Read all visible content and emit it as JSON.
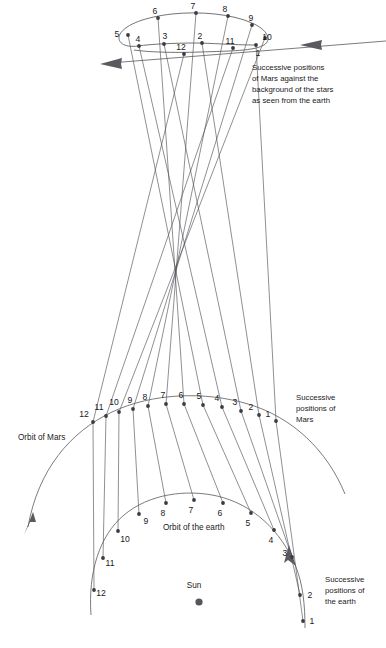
{
  "figure": {
    "type": "astronomical-diagram"
  },
  "captions": {
    "stars": {
      "line1": "Successive positions",
      "line2": "of Mars against the",
      "line3": "background of the stars",
      "line4": "as seen from the earth",
      "x": 252,
      "y": 70
    },
    "mars_positions": {
      "line1": "Successive",
      "line2": "positions of",
      "line3": "Mars",
      "x": 296,
      "y": 400
    },
    "earth_positions": {
      "line1": "Successive",
      "line2": "positions of",
      "line3": "the earth",
      "x": 325,
      "y": 582
    },
    "orbit_of_mars": {
      "text": "Orbit of Mars",
      "x": 18,
      "y": 440
    },
    "orbit_of_earth": {
      "text": "Orbit of the earth",
      "x": 163,
      "y": 530
    },
    "sun": {
      "text": "Sun",
      "x": 194,
      "y": 588
    }
  },
  "colors": {
    "background": "#ffffff",
    "line": "#5a5a60",
    "sight_line": "#4a4a52",
    "dot": "#3a3a40",
    "sun": "#55555c",
    "text": "#1a1a1a"
  },
  "chart_data": {
    "type": "scatter",
    "xlabel": "",
    "ylabel": "",
    "series": [
      {
        "name": "Successive positions of the earth",
        "label_anchor": "earth-orbit",
        "points": [
          {
            "n": "1",
            "x": 303,
            "y": 621,
            "lx": 312,
            "ly": 624
          },
          {
            "n": "2",
            "x": 300,
            "y": 595,
            "lx": 310,
            "ly": 598
          },
          {
            "n": "3",
            "x": 292,
            "y": 557,
            "lx": 285,
            "ly": 556
          },
          {
            "n": "4",
            "x": 274,
            "y": 530,
            "lx": 271,
            "ly": 543
          },
          {
            "n": "5",
            "x": 251,
            "y": 513,
            "lx": 248,
            "ly": 526
          },
          {
            "n": "6",
            "x": 223,
            "y": 503,
            "lx": 220,
            "ly": 516
          },
          {
            "n": "7",
            "x": 194,
            "y": 500,
            "lx": 191,
            "ly": 513
          },
          {
            "n": "8",
            "x": 166,
            "y": 503,
            "lx": 163,
            "ly": 516
          },
          {
            "n": "9",
            "x": 139,
            "y": 514,
            "lx": 146,
            "ly": 524
          },
          {
            "n": "10",
            "x": 118,
            "y": 531,
            "lx": 125,
            "ly": 542
          },
          {
            "n": "11",
            "x": 103,
            "y": 558,
            "lx": 110,
            "ly": 566
          },
          {
            "n": "12",
            "x": 94,
            "y": 590,
            "lx": 101,
            "ly": 596
          }
        ]
      },
      {
        "name": "Successive positions of Mars",
        "label_anchor": "mars-orbit",
        "points": [
          {
            "n": "1",
            "x": 276,
            "y": 421,
            "lx": 268,
            "ly": 417
          },
          {
            "n": "2",
            "x": 259,
            "y": 415,
            "lx": 251,
            "ly": 410
          },
          {
            "n": "3",
            "x": 241,
            "y": 411,
            "lx": 235,
            "ly": 405
          },
          {
            "n": "4",
            "x": 222,
            "y": 407,
            "lx": 217,
            "ly": 401
          },
          {
            "n": "5",
            "x": 203,
            "y": 405,
            "lx": 199,
            "ly": 399
          },
          {
            "n": "6",
            "x": 184,
            "y": 404,
            "lx": 181,
            "ly": 398
          },
          {
            "n": "7",
            "x": 166,
            "y": 404,
            "lx": 163,
            "ly": 398
          },
          {
            "n": "8",
            "x": 148,
            "y": 406,
            "lx": 145,
            "ly": 400
          },
          {
            "n": "9",
            "x": 133,
            "y": 409,
            "lx": 130,
            "ly": 403
          },
          {
            "n": "10",
            "x": 119,
            "y": 412,
            "lx": 114,
            "ly": 405
          },
          {
            "n": "11",
            "x": 106,
            "y": 416,
            "lx": 99,
            "ly": 410
          },
          {
            "n": "12",
            "x": 93,
            "y": 422,
            "lx": 84,
            "ly": 417
          }
        ]
      },
      {
        "name": "Successive positions of Mars against the stars",
        "label_anchor": "star-loop",
        "points": [
          {
            "n": "1",
            "x": 256,
            "y": 45,
            "lx": 258,
            "ly": 56
          },
          {
            "n": "2",
            "x": 202,
            "y": 43,
            "lx": 200,
            "ly": 39
          },
          {
            "n": "3",
            "x": 164,
            "y": 44,
            "lx": 165,
            "ly": 39
          },
          {
            "n": "4",
            "x": 139,
            "y": 46,
            "lx": 138,
            "ly": 42
          },
          {
            "n": "5",
            "x": 128,
            "y": 35,
            "lx": 117,
            "ly": 37
          },
          {
            "n": "6",
            "x": 158,
            "y": 18,
            "lx": 155,
            "ly": 14
          },
          {
            "n": "7",
            "x": 196,
            "y": 13,
            "lx": 193,
            "ly": 9
          },
          {
            "n": "8",
            "x": 228,
            "y": 16,
            "lx": 225,
            "ly": 12
          },
          {
            "n": "9",
            "x": 252,
            "y": 25,
            "lx": 251,
            "ly": 21
          },
          {
            "n": "10",
            "x": 265,
            "y": 38,
            "lx": 267,
            "ly": 40
          },
          {
            "n": "11",
            "x": 233,
            "y": 48,
            "lx": 230,
            "ly": 44
          },
          {
            "n": "12",
            "x": 184,
            "y": 54,
            "lx": 181,
            "ly": 50
          }
        ]
      }
    ]
  }
}
